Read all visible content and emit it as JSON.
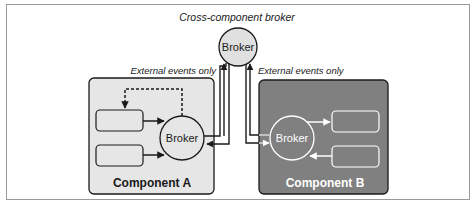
{
  "diagram": {
    "title": "Cross-component broker",
    "central_broker": {
      "label": "Broker"
    },
    "left_edge_label": "External events only",
    "right_edge_label": "External events only",
    "components": [
      {
        "name": "Component A",
        "broker_label": "Broker",
        "fill": "#e6e6e6",
        "text_color": "#1a1a1a",
        "processors": 2
      },
      {
        "name": "Component B",
        "broker_label": "Broker",
        "fill": "#808080",
        "text_color": "#ffffff",
        "processors": 2
      }
    ],
    "colors": {
      "stroke": "#1a1a1a",
      "central_broker_fill": "#e0e0e0",
      "frame": "#9a9a9a"
    }
  }
}
